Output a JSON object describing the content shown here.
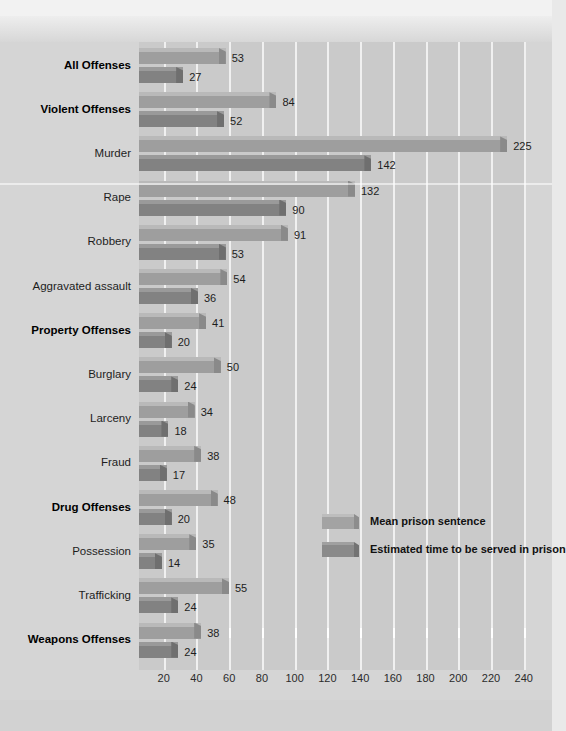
{
  "chart_data": {
    "type": "bar",
    "orientation": "horizontal",
    "title": "",
    "xlabel": "Average time served (months)",
    "ylabel": "",
    "xlim": [
      0,
      240
    ],
    "xticks": [
      20,
      40,
      60,
      80,
      100,
      120,
      140,
      160,
      180,
      200,
      220,
      240
    ],
    "grid": true,
    "legend_position": "inside-right",
    "categories": [
      "All Offenses",
      "Violent Offenses",
      "Murder",
      "Rape",
      "Robbery",
      "Aggravated assault",
      "Property Offenses",
      "Burglary",
      "Larceny",
      "Fraud",
      "Drug Offenses",
      "Possession",
      "Trafficking",
      "Weapons Offenses"
    ],
    "category_emphasis": [
      true,
      true,
      false,
      false,
      false,
      false,
      true,
      false,
      false,
      false,
      true,
      false,
      false,
      true
    ],
    "series": [
      {
        "name": "Mean prison sentence",
        "values": [
          53,
          84,
          225,
          132,
          91,
          54,
          41,
          50,
          34,
          38,
          48,
          35,
          55,
          38
        ]
      },
      {
        "name": "Estimated time to be served in prison",
        "values": [
          27,
          52,
          142,
          90,
          53,
          36,
          20,
          24,
          18,
          17,
          20,
          14,
          24,
          24
        ]
      }
    ]
  },
  "legend": {
    "items": [
      {
        "label": "Mean prison sentence",
        "key": "mean"
      },
      {
        "label": "Estimated time to be served in prison",
        "key": "served"
      }
    ]
  },
  "colors": {
    "page_background": "#d5d5d5",
    "plot_background": "#cacaca",
    "gridline": "#f0f0f0",
    "mean_bar": "#9e9e9e",
    "served_bar": "#828282",
    "label_text": "#1d1d1d"
  }
}
